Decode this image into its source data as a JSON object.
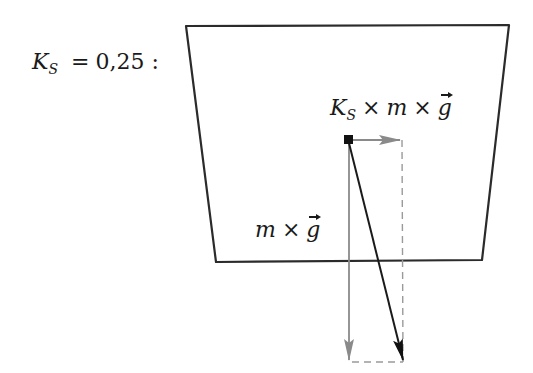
{
  "diagram": {
    "coefficient_label": {
      "symbol": "K",
      "subscript": "S",
      "relation": "=",
      "value": "0,25",
      "suffix": ":"
    },
    "horizontal_force_label": {
      "coef": "K",
      "coef_sub": "S",
      "times1": "×",
      "mass": "m",
      "times2": "×",
      "vector": "g"
    },
    "weight_force_label": {
      "mass": "m",
      "times": "×",
      "vector": "g"
    },
    "colors": {
      "outline": "#2b2b2b",
      "resultant_arrow": "#1a1a1a",
      "component_arrow": "#8a8a8a",
      "dashed_guide": "#9a9a9a",
      "mass_point": "#111111"
    },
    "geometry": {
      "block_polygon": [
        [
          186,
          26
        ],
        [
          509,
          25
        ],
        [
          482,
          260
        ],
        [
          216,
          262
        ]
      ],
      "mass_point": [
        348,
        140
      ],
      "horizontal_arrow_end": [
        402,
        140
      ],
      "vertical_arrow_end": [
        349,
        361
      ],
      "resultant_arrow_end": [
        404,
        361
      ]
    }
  }
}
